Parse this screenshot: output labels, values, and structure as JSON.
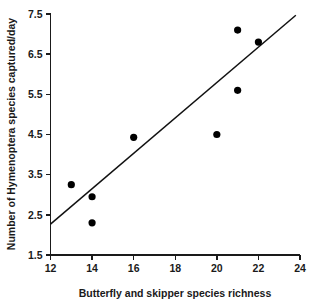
{
  "chart_data": {
    "type": "scatter",
    "title": "",
    "xlabel": "Butterfly and skipper species richness",
    "ylabel": "Number of Hymenoptera species captured/day",
    "xlim": [
      12,
      24
    ],
    "ylim": [
      1.5,
      7.5
    ],
    "xticks": [
      12,
      14,
      16,
      18,
      20,
      22,
      24
    ],
    "yticks": [
      1.5,
      2.5,
      3.5,
      4.5,
      5.5,
      6.5,
      7.5
    ],
    "xtick_labels": [
      "12",
      "14",
      "16",
      "18",
      "20",
      "22",
      "24"
    ],
    "ytick_labels": [
      "1.5",
      "2.5",
      "3.5",
      "4.5",
      "5.5",
      "6.5",
      "7.5"
    ],
    "grid": false,
    "legend": false,
    "marker": "filled-circle",
    "marker_color": "#000000",
    "points": [
      {
        "x": 13,
        "y": 3.25
      },
      {
        "x": 14,
        "y": 2.95
      },
      {
        "x": 14,
        "y": 2.3
      },
      {
        "x": 16,
        "y": 4.43
      },
      {
        "x": 20,
        "y": 4.5
      },
      {
        "x": 21,
        "y": 7.1
      },
      {
        "x": 21,
        "y": 5.6
      },
      {
        "x": 22,
        "y": 6.8
      }
    ],
    "trendline": {
      "type": "linear-fit",
      "color": "#111111",
      "x_start": 12,
      "y_start": 2.27,
      "x_end": 23.8,
      "y_end": 7.47,
      "slope": 0.44,
      "intercept": -3.02
    }
  },
  "colors": {
    "axis": "#1a1a1a",
    "point": "#000000",
    "line": "#111111",
    "background": "#ffffff"
  }
}
